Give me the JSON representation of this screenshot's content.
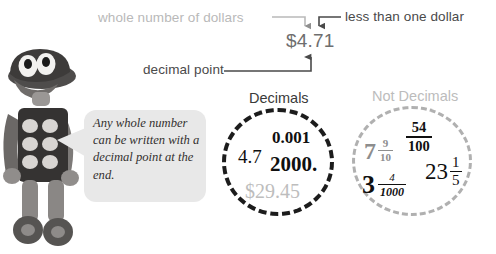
{
  "annotations": {
    "whole_number_label": "whole number of dollars",
    "less_than_label": "less than one dollar",
    "decimal_point_label": "decimal point",
    "amount": "$4.71"
  },
  "character": {
    "alt": "clay figure mascot"
  },
  "speech_bubble": {
    "text": "Any whole number can be written with a decimal point at the end."
  },
  "categories": [
    {
      "heading": "Decimals",
      "items": [
        {
          "label": "4.7",
          "style": "plain"
        },
        {
          "label": "0.001",
          "style": "bold"
        },
        {
          "label": "2000.",
          "style": "bold"
        },
        {
          "label": "$29.45",
          "style": "gray"
        }
      ]
    },
    {
      "heading": "Not Decimals",
      "items": [
        {
          "whole": "7",
          "numerator": "9",
          "denominator": "10",
          "style": "gray"
        },
        {
          "whole": "",
          "numerator": "54",
          "denominator": "100",
          "style": "bold"
        },
        {
          "whole": "23",
          "numerator": "1",
          "denominator": "5",
          "style": "plain"
        },
        {
          "whole": "3",
          "numerator": "4",
          "denominator": "1000",
          "style": "italic"
        }
      ]
    }
  ],
  "colors": {
    "light_gray_text": "#b9b9b9",
    "dark_gray_text": "#4a4a4a",
    "amount_text": "#6e6e6e",
    "bubble_bg": "#e8e8e8",
    "decimals_circle_border": "#1c1c1c",
    "not_decimals_circle_border": "#b0b0b0"
  }
}
